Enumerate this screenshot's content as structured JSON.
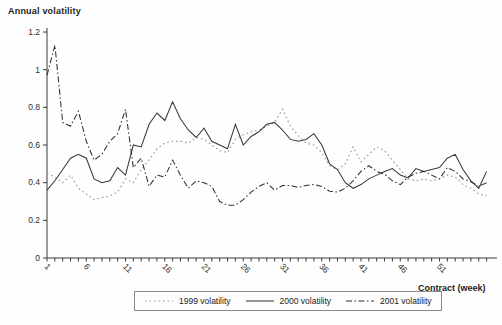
{
  "colors": {
    "background": "#fefefe",
    "axis": "#3a3a3a",
    "tick_text": "#2e2e2e",
    "legend_border": "#8a8a8a"
  },
  "chart_data": {
    "type": "line",
    "title": "Annual volatility",
    "xlabel": "Contract (week)",
    "ylabel": "Annual volatility",
    "xlim": [
      1,
      57
    ],
    "ylim": [
      0,
      1.2
    ],
    "grid": false,
    "legend_position": "bottom",
    "y_ticks": {
      "values": [
        0,
        0.2,
        0.4,
        0.6,
        0.8,
        1,
        1.2
      ],
      "labels": [
        "0",
        "0.2",
        "0.4",
        "0.6",
        "0.8",
        "1",
        "1.2"
      ]
    },
    "x_major_ticks": [
      1,
      6,
      11,
      16,
      21,
      26,
      31,
      36,
      41,
      46,
      51
    ],
    "x_major_tick_labels": [
      "1",
      "6",
      "11",
      "16",
      "21",
      "26",
      "31",
      "36",
      "41",
      "46",
      "51"
    ],
    "x": [
      1,
      2,
      3,
      4,
      5,
      6,
      7,
      8,
      9,
      10,
      11,
      12,
      13,
      14,
      15,
      16,
      17,
      18,
      19,
      20,
      21,
      22,
      23,
      24,
      25,
      26,
      27,
      28,
      29,
      30,
      31,
      32,
      33,
      34,
      35,
      36,
      37,
      38,
      39,
      40,
      41,
      42,
      43,
      44,
      45,
      46,
      47,
      48,
      49,
      50,
      51,
      52,
      53,
      54,
      55,
      56,
      57
    ],
    "series": [
      {
        "name": "1999 volatility",
        "style": "dotted",
        "color": "#9d9d9d",
        "values": [
          0.45,
          0.43,
          0.4,
          0.44,
          0.37,
          0.34,
          0.31,
          0.32,
          0.33,
          0.35,
          0.42,
          0.4,
          0.47,
          0.52,
          0.58,
          0.61,
          0.62,
          0.62,
          0.61,
          0.64,
          0.63,
          0.6,
          0.57,
          0.56,
          0.63,
          0.655,
          0.67,
          0.68,
          0.7,
          0.72,
          0.79,
          0.7,
          0.65,
          0.61,
          0.6,
          0.56,
          0.49,
          0.47,
          0.5,
          0.59,
          0.51,
          0.55,
          0.59,
          0.57,
          0.52,
          0.47,
          0.42,
          0.41,
          0.42,
          0.41,
          0.42,
          0.44,
          0.43,
          0.39,
          0.37,
          0.34,
          0.33
        ]
      },
      {
        "name": "2000 volatility",
        "style": "solid",
        "color": "#383838",
        "values": [
          0.36,
          0.41,
          0.47,
          0.53,
          0.55,
          0.53,
          0.42,
          0.4,
          0.41,
          0.48,
          0.44,
          0.6,
          0.59,
          0.71,
          0.77,
          0.73,
          0.83,
          0.74,
          0.68,
          0.64,
          0.69,
          0.62,
          0.6,
          0.58,
          0.71,
          0.6,
          0.645,
          0.67,
          0.71,
          0.72,
          0.68,
          0.63,
          0.62,
          0.63,
          0.66,
          0.6,
          0.5,
          0.47,
          0.4,
          0.37,
          0.39,
          0.42,
          0.44,
          0.46,
          0.475,
          0.44,
          0.425,
          0.475,
          0.46,
          0.47,
          0.48,
          0.53,
          0.55,
          0.47,
          0.41,
          0.37,
          0.46
        ]
      },
      {
        "name": "2001 volatility",
        "style": "dashdot",
        "color": "#2f2f2f",
        "values": [
          0.97,
          1.13,
          0.72,
          0.7,
          0.78,
          0.62,
          0.52,
          0.55,
          0.62,
          0.66,
          0.79,
          0.48,
          0.53,
          0.38,
          0.44,
          0.43,
          0.52,
          0.44,
          0.37,
          0.41,
          0.4,
          0.38,
          0.3,
          0.28,
          0.28,
          0.31,
          0.35,
          0.38,
          0.4,
          0.36,
          0.385,
          0.385,
          0.375,
          0.385,
          0.39,
          0.38,
          0.355,
          0.35,
          0.37,
          0.41,
          0.46,
          0.49,
          0.46,
          0.445,
          0.41,
          0.39,
          0.43,
          0.45,
          0.46,
          0.44,
          0.42,
          0.48,
          0.46,
          0.42,
          0.405,
          0.38,
          0.4
        ]
      }
    ]
  }
}
